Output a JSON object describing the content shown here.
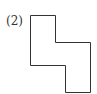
{
  "diagram": {
    "label": "(2)",
    "shape": {
      "type": "polygon",
      "stroke": "#333333",
      "fill": "none",
      "points": "30.5,15.5 55.5,15.5 55.5,42.5 90.5,42.5 90.5,92.5 65.5,92.5 65.5,65.5 30.5,65.5"
    }
  }
}
